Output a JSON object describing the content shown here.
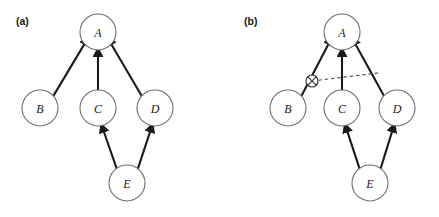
{
  "figure": {
    "background_color": "#ffffff",
    "width": 439,
    "height": 217
  },
  "panels": [
    {
      "id": "panel-a",
      "label": "(a)",
      "label_x": 16,
      "label_y": 25,
      "nodes": [
        {
          "id": "A",
          "label": "A",
          "cx": 98,
          "cy": 32,
          "r": 18
        },
        {
          "id": "B",
          "label": "B",
          "cx": 40,
          "cy": 108,
          "r": 18
        },
        {
          "id": "C",
          "label": "C",
          "cx": 98,
          "cy": 108,
          "r": 18
        },
        {
          "id": "D",
          "label": "D",
          "cx": 155,
          "cy": 108,
          "r": 18
        },
        {
          "id": "E",
          "label": "E",
          "cx": 127,
          "cy": 183,
          "r": 18
        }
      ],
      "edges": [
        {
          "id": "edge-b-a",
          "from": "B",
          "to": "A",
          "style": "solid",
          "arrow": true
        },
        {
          "id": "edge-c-a",
          "from": "C",
          "to": "A",
          "style": "solid",
          "arrow": true
        },
        {
          "id": "edge-d-a",
          "from": "D",
          "to": "A",
          "style": "solid",
          "arrow": true
        },
        {
          "id": "edge-e-c",
          "from": "E",
          "to": "C",
          "style": "solid",
          "arrow": true
        },
        {
          "id": "edge-e-d",
          "from": "E",
          "to": "D",
          "style": "solid",
          "arrow": true
        }
      ],
      "markers": []
    },
    {
      "id": "panel-b",
      "label": "(b)",
      "label_x": 244,
      "label_y": 25,
      "nodes": [
        {
          "id": "A",
          "label": "A",
          "cx": 342,
          "cy": 32,
          "r": 18
        },
        {
          "id": "B",
          "label": "B",
          "cx": 288,
          "cy": 108,
          "r": 18
        },
        {
          "id": "C",
          "label": "C",
          "cx": 342,
          "cy": 108,
          "r": 18
        },
        {
          "id": "D",
          "label": "D",
          "cx": 397,
          "cy": 108,
          "r": 18
        },
        {
          "id": "E",
          "label": "E",
          "cx": 370,
          "cy": 183,
          "r": 18
        }
      ],
      "edges": [
        {
          "id": "edge-b-a",
          "from": "B",
          "to": "A",
          "style": "solid",
          "arrow": true
        },
        {
          "id": "edge-c-a",
          "from": "C",
          "to": "A",
          "style": "solid",
          "arrow": true
        },
        {
          "id": "edge-d-a",
          "from": "D",
          "to": "A",
          "style": "solid",
          "arrow": true
        },
        {
          "id": "edge-e-c",
          "from": "E",
          "to": "C",
          "style": "solid",
          "arrow": true
        },
        {
          "id": "edge-e-d",
          "from": "E",
          "to": "D",
          "style": "solid",
          "arrow": true
        }
      ],
      "markers": [
        {
          "id": "block-marker",
          "symbol": "circled-cross",
          "cx": 312,
          "cy": 81,
          "r": 6,
          "on_edge": "edge-b-a"
        }
      ],
      "annotations": [
        {
          "id": "dashed-connector",
          "style": "dashed",
          "from_x": 318,
          "from_y": 80,
          "to_x": 381,
          "to_y": 73,
          "description": "dashed line from circled-cross marker to the D-to-A edge"
        }
      ]
    }
  ],
  "colors": {
    "node_stroke": "#6e6e6e",
    "node_fill": "#ffffff",
    "edge": "#1a1a1a",
    "dashed": "#4a4a4a",
    "text": "#1a1a1a"
  }
}
